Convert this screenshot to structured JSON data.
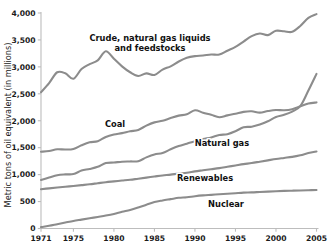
{
  "chart_data": {
    "type": "line",
    "title": "",
    "xlabel": "",
    "ylabel": "Metric tons of oil equivalent (in millions)",
    "xlim": [
      1971,
      2005
    ],
    "ylim": [
      0,
      4000
    ],
    "grid": false,
    "legend_position": "inline-labels",
    "x_tick_labels": [
      "1971",
      "1975",
      "1980",
      "1985",
      "1990",
      "1995",
      "2000",
      "2005"
    ],
    "x_ticks": [
      1971,
      1975,
      1980,
      1985,
      1990,
      1995,
      2000,
      2005
    ],
    "y_tick_labels": [
      "0",
      "500",
      "1,000",
      "1,500",
      "2,000",
      "2,500",
      "3,000",
      "3,500",
      "4,000"
    ],
    "y_ticks": [
      0,
      500,
      1000,
      1500,
      2000,
      2500,
      3000,
      3500,
      4000
    ],
    "line_color": "#8c8c8c",
    "x": [
      1971,
      1972,
      1973,
      1974,
      1975,
      1976,
      1977,
      1978,
      1979,
      1980,
      1981,
      1982,
      1983,
      1984,
      1985,
      1986,
      1987,
      1988,
      1989,
      1990,
      1991,
      1992,
      1993,
      1994,
      1995,
      1996,
      1997,
      1998,
      1999,
      2000,
      2001,
      2002,
      2003,
      2004,
      2005
    ],
    "series": [
      {
        "name": "Crude, natural gas liquids and feedstocks",
        "label": "Crude, natural gas liquids\nand feedstocks",
        "label_line1": "Crude, natural gas liquids",
        "label_line2": "and feedstocks",
        "values": [
          2530,
          2700,
          2900,
          2880,
          2780,
          2960,
          3050,
          3120,
          3290,
          3150,
          3010,
          2900,
          2830,
          2880,
          2850,
          2950,
          3010,
          3100,
          3170,
          3200,
          3210,
          3230,
          3230,
          3300,
          3370,
          3470,
          3570,
          3620,
          3590,
          3670,
          3660,
          3650,
          3760,
          3910,
          3980
        ]
      },
      {
        "name": "Coal",
        "label": "Coal",
        "values": [
          1425,
          1440,
          1470,
          1465,
          1475,
          1545,
          1600,
          1620,
          1700,
          1745,
          1770,
          1805,
          1830,
          1910,
          1970,
          2000,
          2050,
          2095,
          2120,
          2195,
          2150,
          2110,
          2065,
          2100,
          2130,
          2165,
          2175,
          2150,
          2180,
          2200,
          2195,
          2215,
          2270,
          2320,
          2340
        ]
      },
      {
        "name": "Natural gas",
        "label": "Natural gas",
        "values": [
          900,
          945,
          990,
          1005,
          1010,
          1075,
          1105,
          1145,
          1215,
          1225,
          1240,
          1245,
          1250,
          1320,
          1375,
          1400,
          1470,
          1530,
          1575,
          1620,
          1660,
          1690,
          1735,
          1750,
          1805,
          1880,
          1890,
          1930,
          1990,
          2070,
          2110,
          2170,
          2270,
          2560,
          2870
        ]
      },
      {
        "name": "Renewables",
        "label": "Renewables",
        "values": [
          730,
          745,
          760,
          775,
          790,
          805,
          820,
          840,
          860,
          875,
          890,
          905,
          925,
          945,
          965,
          985,
          1000,
          1020,
          1035,
          1060,
          1080,
          1100,
          1120,
          1145,
          1170,
          1195,
          1215,
          1240,
          1265,
          1290,
          1310,
          1330,
          1360,
          1400,
          1430
        ]
      },
      {
        "name": "Nuclear",
        "label": "Nuclear",
        "values": [
          25,
          50,
          80,
          110,
          140,
          165,
          190,
          215,
          240,
          270,
          310,
          345,
          390,
          440,
          490,
          520,
          545,
          570,
          580,
          600,
          615,
          625,
          635,
          645,
          655,
          665,
          670,
          678,
          685,
          692,
          698,
          702,
          706,
          710,
          715
        ]
      }
    ],
    "series_label_positions": [
      {
        "name": "Crude, natural gas liquids and feedstocks",
        "x": 150,
        "y": 41
      },
      {
        "name": "Coal",
        "x": 115,
        "y": 127
      },
      {
        "name": "Natural gas",
        "x": 222,
        "y": 146
      },
      {
        "name": "Renewables",
        "x": 205,
        "y": 181
      },
      {
        "name": "Nuclear",
        "x": 226,
        "y": 207
      }
    ]
  },
  "axes": {
    "y_axis_title": "Metric tons of oil equivalent (in millions)"
  }
}
